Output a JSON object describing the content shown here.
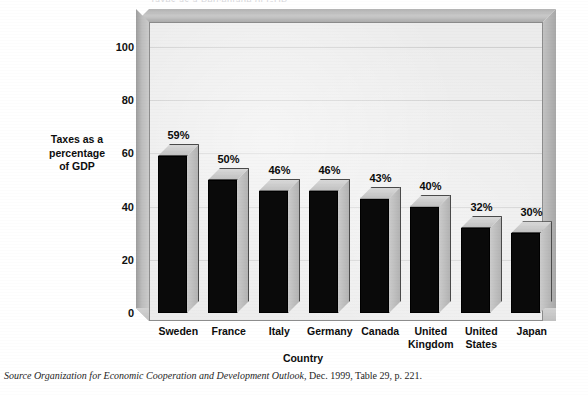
{
  "figure": {
    "cropped_top_text": "Taxes as a Percentage of GDP",
    "source_note_italic": "Source Organization for Economic Cooperation and Development Outlook,",
    "source_note_roman": " Dec. 1999, Table 29, p. 221."
  },
  "chart_data": {
    "type": "bar",
    "title": "",
    "xlabel": "Country",
    "ylabel": "Taxes as a percentage of GDP",
    "ylabel_lines": [
      "Taxes as a",
      "percentage",
      "of GDP"
    ],
    "categories": [
      "Sweden",
      "France",
      "Italy",
      "Germany",
      "Canada",
      "United Kingdom",
      "United States",
      "Japan"
    ],
    "category_lines": [
      [
        "Sweden"
      ],
      [
        "France"
      ],
      [
        "Italy"
      ],
      [
        "Germany"
      ],
      [
        "Canada"
      ],
      [
        "United",
        "Kingdom"
      ],
      [
        "United",
        "States"
      ],
      [
        "Japan"
      ]
    ],
    "values": [
      59,
      50,
      46,
      46,
      43,
      40,
      32,
      30
    ],
    "data_labels": [
      "59%",
      "50%",
      "46%",
      "46%",
      "43%",
      "40%",
      "32%",
      "30%"
    ],
    "ylim": [
      0,
      110
    ],
    "yticks": [
      0,
      20,
      40,
      60,
      80,
      100
    ],
    "ytick_labels": [
      "0",
      "20",
      "40",
      "60",
      "80",
      "100"
    ],
    "grid": true,
    "grid_axis": "y",
    "legend": null,
    "style": "3d-column",
    "colors": {
      "bar_front": "#0a0a0a",
      "bar_top": "#d0d0d0",
      "bar_side": "#bdbdbd",
      "plot_background": "#ececec",
      "frame": "#bdbdbd",
      "gridline": "#cfcfcf",
      "text": "#111111"
    }
  }
}
